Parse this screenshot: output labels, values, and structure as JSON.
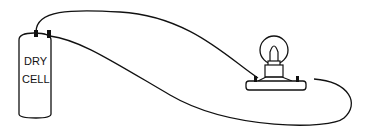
{
  "diagram": {
    "type": "circuit",
    "components": [
      {
        "id": "battery",
        "kind": "dry-cell",
        "label_line1": "DRY",
        "label_line2": "CELL"
      },
      {
        "id": "bulb",
        "kind": "light-bulb-on-socket"
      }
    ],
    "wires": [
      {
        "from": "battery-terminal-left",
        "to": "bulb-terminal-left"
      },
      {
        "from": "battery-terminal-right",
        "to": "bulb-terminal-right"
      }
    ],
    "colors": {
      "stroke": "#111111",
      "background": "#ffffff"
    }
  }
}
